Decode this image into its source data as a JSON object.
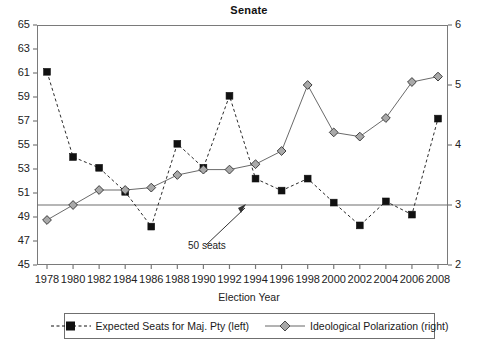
{
  "chart_data": {
    "type": "line",
    "title": "Senate",
    "xlabel": "Election Year",
    "ylabel_left": "",
    "ylabel_right": "",
    "grid": false,
    "legend_position": "bottom",
    "x": [
      1978,
      1980,
      1982,
      1984,
      1986,
      1988,
      1990,
      1992,
      1994,
      1996,
      1998,
      2000,
      2002,
      2004,
      2006,
      2008
    ],
    "xtick_labels": [
      "1978",
      "1980",
      "1982",
      "1984",
      "1986",
      "1988",
      "1990",
      "1992",
      "1994",
      "1996",
      "1998",
      "2000",
      "2002",
      "2004",
      "2006",
      "2008"
    ],
    "ylim_left": [
      45,
      65
    ],
    "ytick_left": [
      45,
      47,
      49,
      51,
      53,
      55,
      57,
      59,
      61,
      63,
      65
    ],
    "ylim_right": [
      2,
      6
    ],
    "ytick_right": [
      2,
      3,
      4,
      5,
      6
    ],
    "series": [
      {
        "name": "Expected Seats for Maj. Pty (left)",
        "axis": "left",
        "marker": "square",
        "linestyle": "dashed",
        "color": "#111111",
        "values": [
          61.1,
          54.0,
          53.1,
          51.1,
          48.2,
          55.1,
          53.1,
          59.1,
          52.2,
          51.2,
          52.2,
          50.2,
          48.3,
          50.3,
          49.2,
          57.2
        ]
      },
      {
        "name": "Ideological Polarization (right)",
        "axis": "right",
        "marker": "diamond",
        "linestyle": "solid",
        "color": "#8a8a8a",
        "values": [
          2.75,
          3.0,
          3.25,
          3.25,
          3.29,
          3.5,
          3.59,
          3.59,
          3.68,
          3.9,
          5.0,
          4.21,
          4.14,
          4.45,
          5.05,
          5.14
        ]
      }
    ],
    "annotations": [
      {
        "text": "50 seats",
        "value_left": 50,
        "type": "hline-with-arrow"
      }
    ]
  },
  "axis": {
    "left_ticks": [
      "65",
      "63",
      "61",
      "59",
      "57",
      "55",
      "53",
      "51",
      "49",
      "47",
      "45"
    ],
    "right_ticks": [
      "6",
      "5",
      "4",
      "3",
      "2"
    ]
  },
  "legend": {
    "entries": [
      {
        "label": "Expected Seats for Maj. Pty (left)",
        "marker": "square",
        "style": "dashed"
      },
      {
        "label": "Ideological Polarization (right)",
        "marker": "diamond",
        "style": "solid"
      }
    ]
  },
  "colors": {
    "axis": "#7a7a7a",
    "series_square": "#111111",
    "series_diamond": "#8a8a8a",
    "text": "#1a1a1a"
  }
}
